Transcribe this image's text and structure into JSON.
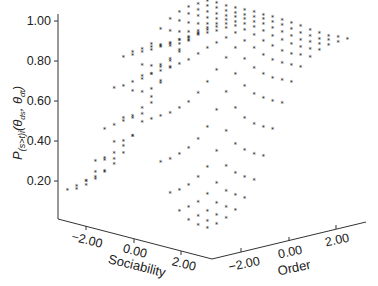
{
  "chart_data": {
    "type": "scatter3d",
    "title": "",
    "zlabel": "P(s>t)i(θds, θdt)",
    "zlabel_parts": {
      "main": "P",
      "sub": "(s>t)i",
      "args": "(θ",
      "ds": "ds",
      "sep": ", θ",
      "dt": "dt",
      "close": ")"
    },
    "xlabel": "Sociability",
    "ylabel": "Order",
    "z_ticks": [
      "0.20",
      "0.40",
      "0.60",
      "0.80",
      "1.00"
    ],
    "z_tick_values": [
      0.2,
      0.4,
      0.6,
      0.8,
      1.0
    ],
    "x_ticks": [
      "−2.00",
      "0.00",
      "2.00"
    ],
    "x_tick_values": [
      -2,
      0,
      2
    ],
    "y_ticks": [
      "−2.00",
      "0.00",
      "2.00"
    ],
    "y_tick_values": [
      -2,
      0,
      2
    ],
    "x_range": [
      -3,
      3
    ],
    "y_range": [
      -3,
      3
    ],
    "z_range": [
      0,
      1.05
    ],
    "marker": "asterisk",
    "grid": {
      "sociability": [
        -3.0,
        -2.6,
        -2.2,
        -1.8,
        -1.4,
        -1.0,
        -0.6,
        -0.2,
        0.2,
        0.6,
        1.0,
        1.4,
        1.8,
        2.2,
        2.6,
        3.0
      ],
      "order": [
        -3.0,
        -2.6,
        -2.2,
        -1.8,
        -1.4,
        -1.0,
        -0.6,
        -0.2,
        0.2,
        0.6,
        1.0,
        1.4,
        1.8,
        2.2,
        2.6,
        3.0
      ],
      "description": "P rises with Order toward ~0.97; at low Order, P peaks (~0.97) near Sociability ≈ -0.3 and dips to ~0.1 at both ends"
    }
  }
}
